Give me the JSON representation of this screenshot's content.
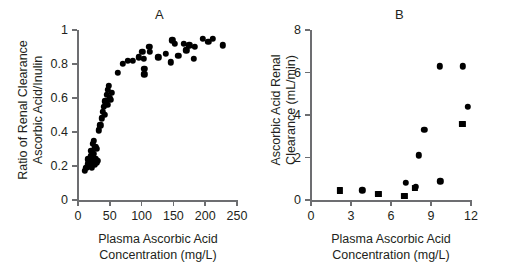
{
  "figure": {
    "background": "#ffffff",
    "marker_color": "#000000",
    "axis_color": "#6d6e71",
    "text_color": "#231f20"
  },
  "panels": [
    {
      "letter": "A",
      "chart_data": {
        "type": "scatter",
        "title": "A",
        "xlabel": "Plasma Ascorbic Acid Concentration (mg/L)",
        "xlabel_line1": "Plasma Ascorbic Acid",
        "xlabel_line2": "Concentration (mg/L)",
        "ylabel": "Ratio of Renal Clearance Ascorbic Acid/Inulin",
        "ylabel_line1": "Ratio of Renal Clearance",
        "ylabel_line2": "Ascorbic Acid/Inulin",
        "xlim": [
          0,
          250
        ],
        "ylim": [
          0,
          1
        ],
        "xticks": [
          0,
          50,
          100,
          150,
          200,
          250
        ],
        "xticklabels": [
          "0",
          "50",
          "100",
          "150",
          "200",
          "250"
        ],
        "yticks": [
          0,
          0.2,
          0.4,
          0.6,
          0.8,
          1
        ],
        "yticklabels": [
          "0",
          "0.2",
          "0.4",
          "0.6",
          "0.8",
          "1"
        ],
        "grid": false,
        "legend": false,
        "series": [
          {
            "name": "Ascorbic acid / inulin clearance ratio",
            "marker": "circle",
            "points": [
              [
                11,
                0.17
              ],
              [
                13,
                0.19
              ],
              [
                15,
                0.21
              ],
              [
                16,
                0.24
              ],
              [
                18,
                0.23
              ],
              [
                19,
                0.2
              ],
              [
                20,
                0.26
              ],
              [
                20,
                0.22
              ],
              [
                21,
                0.29
              ],
              [
                22,
                0.19
              ],
              [
                22,
                0.25
              ],
              [
                23,
                0.33
              ],
              [
                23,
                0.22
              ],
              [
                24,
                0.27
              ],
              [
                25,
                0.35
              ],
              [
                25,
                0.23
              ],
              [
                26,
                0.21
              ],
              [
                27,
                0.31
              ],
              [
                28,
                0.24
              ],
              [
                29,
                0.22
              ],
              [
                30,
                0.3
              ],
              [
                31,
                0.23
              ],
              [
                33,
                0.41
              ],
              [
                35,
                0.44
              ],
              [
                37,
                0.48
              ],
              [
                39,
                0.52
              ],
              [
                41,
                0.55
              ],
              [
                42,
                0.5
              ],
              [
                43,
                0.58
              ],
              [
                45,
                0.62
              ],
              [
                46,
                0.56
              ],
              [
                47,
                0.65
              ],
              [
                48,
                0.67
              ],
              [
                50,
                0.6
              ],
              [
                51,
                0.59
              ],
              [
                53,
                0.63
              ],
              [
                63,
                0.75
              ],
              [
                70,
                0.8
              ],
              [
                78,
                0.82
              ],
              [
                86,
                0.82
              ],
              [
                96,
                0.84
              ],
              [
                101,
                0.87
              ],
              [
                103,
                0.83
              ],
              [
                104,
                0.77
              ],
              [
                104,
                0.74
              ],
              [
                112,
                0.9
              ],
              [
                113,
                0.87
              ],
              [
                126,
                0.84
              ],
              [
                138,
                0.86
              ],
              [
                146,
                0.81
              ],
              [
                148,
                0.94
              ],
              [
                152,
                0.92
              ],
              [
                158,
                0.85
              ],
              [
                166,
                0.92
              ],
              [
                170,
                0.88
              ],
              [
                175,
                0.91
              ],
              [
                182,
                0.83
              ],
              [
                184,
                0.9
              ],
              [
                196,
                0.95
              ],
              [
                205,
                0.93
              ],
              [
                212,
                0.95
              ],
              [
                228,
                0.91
              ]
            ]
          }
        ]
      }
    },
    {
      "letter": "B",
      "chart_data": {
        "type": "scatter",
        "title": "B",
        "xlabel": "Plasma Ascorbic Acid Concentration (mg/L)",
        "xlabel_line1": "Plasma Ascorbic Acid",
        "xlabel_line2": "Concentration (mg/L)",
        "ylabel": "Ascorbic Acid Renal Clearance (mL/min)",
        "ylabel_line1": "Ascorbic Acid Renal",
        "ylabel_line2": "Clearance (mL/min)",
        "xlim": [
          0,
          12
        ],
        "ylim": [
          0,
          8
        ],
        "xticks": [
          0,
          3,
          6,
          9,
          12
        ],
        "xticklabels": [
          "0",
          "3",
          "6",
          "9",
          "12"
        ],
        "yticks": [
          0,
          2,
          4,
          6,
          8
        ],
        "yticklabels": [
          "0",
          "2",
          "4",
          "6",
          "8"
        ],
        "grid": false,
        "legend": false,
        "series": [
          {
            "name": "Ascorbic acid renal clearance (circles)",
            "marker": "circle",
            "points": [
              [
                3.85,
                0.45
              ],
              [
                7.1,
                0.8
              ],
              [
                7.85,
                0.62
              ],
              [
                8.1,
                2.1
              ],
              [
                8.5,
                3.3
              ],
              [
                9.65,
                6.3
              ],
              [
                9.7,
                0.88
              ],
              [
                11.4,
                6.3
              ],
              [
                11.75,
                4.4
              ]
            ]
          },
          {
            "name": "Ascorbic acid renal clearance (squares)",
            "marker": "square",
            "points": [
              [
                2.15,
                0.45
              ],
              [
                5.05,
                0.3
              ],
              [
                7.0,
                0.18
              ],
              [
                7.8,
                0.58
              ],
              [
                11.35,
                3.6
              ]
            ]
          }
        ]
      }
    }
  ]
}
